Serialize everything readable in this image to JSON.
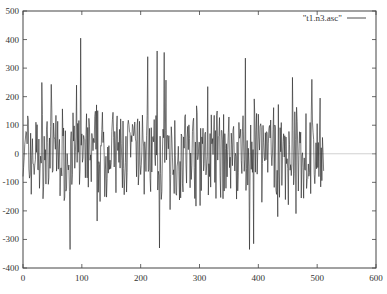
{
  "chart_data": {
    "type": "line",
    "title": "",
    "xlabel": "",
    "ylabel": "",
    "xlim": [
      0,
      600
    ],
    "ylim": [
      -400,
      500
    ],
    "x_ticks": [
      0,
      100,
      200,
      300,
      400,
      500,
      600
    ],
    "y_ticks": [
      -400,
      -300,
      -200,
      -100,
      0,
      100,
      200,
      300,
      400,
      500
    ],
    "grid": false,
    "zero_line": true,
    "legend": {
      "position": "top-right",
      "entries": [
        "\"t1.n3.asc\""
      ]
    },
    "series": [
      {
        "name": "\"t1.n3.asc\"",
        "x_start": 0,
        "x_step": 1,
        "n_points": 512,
        "approx_range": [
          -335,
          405
        ],
        "notable_points": [
          {
            "x": 80,
            "y": -335
          },
          {
            "x": 98,
            "y": 405
          },
          {
            "x": 212,
            "y": 340
          },
          {
            "x": 228,
            "y": 360
          },
          {
            "x": 240,
            "y": 355
          },
          {
            "x": 232,
            "y": -330
          },
          {
            "x": 378,
            "y": 335
          },
          {
            "x": 385,
            "y": -335
          },
          {
            "x": 392,
            "y": -315
          },
          {
            "x": 505,
            "y": 195
          },
          {
            "x": 511,
            "y": -60
          }
        ],
        "seed": 7
      }
    ]
  },
  "colors": {
    "line": "#222222",
    "axis": "#444444",
    "zero_line": "#bbbbbb"
  }
}
